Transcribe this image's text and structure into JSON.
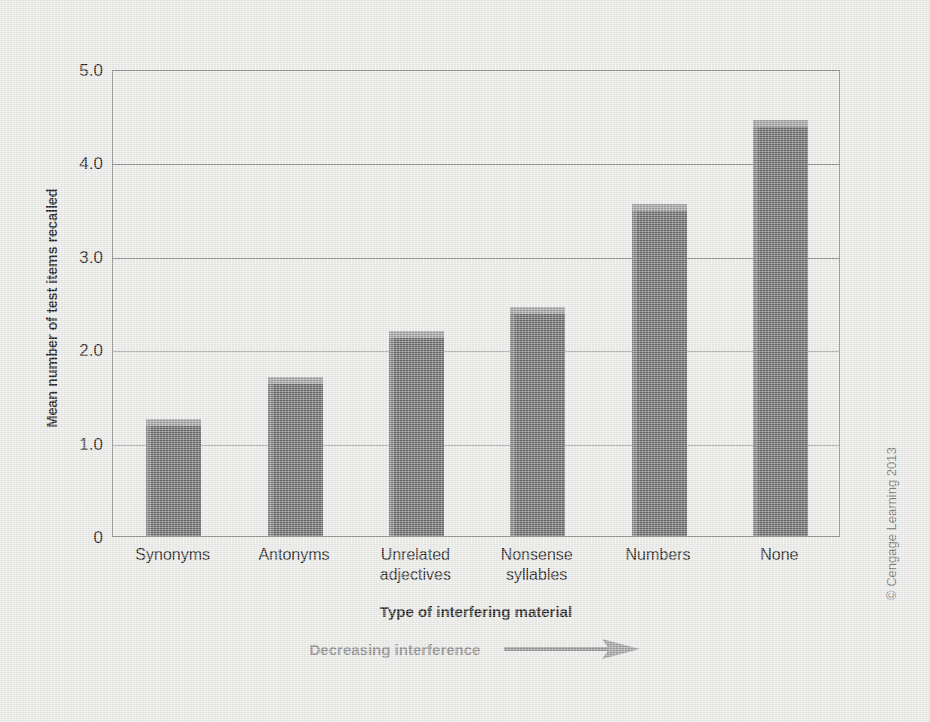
{
  "chart_data": {
    "type": "bar",
    "title": "",
    "xlabel": "Type of interfering material",
    "ylabel": "Mean number of test items recalled",
    "categories": [
      "Synonyms",
      "Antonyms",
      "Unrelated\nadjectives",
      "Nonsense\nsyllables",
      "Numbers",
      "None"
    ],
    "values": [
      1.25,
      1.7,
      2.2,
      2.45,
      3.55,
      4.45
    ],
    "ylim": [
      0,
      5.0
    ],
    "yticks": [
      "0",
      "1.0",
      "2.0",
      "3.0",
      "4.0",
      "5.0"
    ],
    "ytick_values": [
      0,
      1.0,
      2.0,
      3.0,
      4.0,
      5.0
    ],
    "grid": true,
    "legend": "none",
    "annotation": "Decreasing interference",
    "annotation_direction": "right-arrow",
    "bar_color": "#636363",
    "bar_top_color": "#9a9a9a",
    "bar_side_color": "#7b7b7b",
    "grid_color": "#8d8d8d",
    "background_color": "#e8e8e6",
    "text_color": "#1c1c1c",
    "annotation_color": "#8a8a8a"
  },
  "credit": "© Cengage Learning 2013"
}
